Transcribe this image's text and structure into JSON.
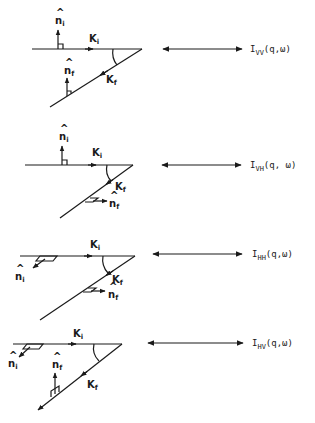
{
  "figure": {
    "rows": [
      {
        "id": "vv",
        "ki_label": "K",
        "ki_sub": "i",
        "kf_label": "K",
        "kf_sub": "f",
        "ni_label": "n",
        "ni_sub": "i",
        "nf_label": "n",
        "nf_sub": "f",
        "intensity_main": "I",
        "intensity_sub": "VV",
        "intensity_args": "(q,ω)",
        "ni_orientation": "vertical-up",
        "nf_orientation": "vertical-up"
      },
      {
        "id": "vh",
        "ki_label": "K",
        "ki_sub": "i",
        "kf_label": "K",
        "kf_sub": "f",
        "ni_label": "n",
        "ni_sub": "i",
        "nf_label": "n",
        "nf_sub": "f",
        "intensity_main": "I",
        "intensity_sub": "VH",
        "intensity_args": "(q, ω)",
        "ni_orientation": "vertical-up",
        "nf_orientation": "horizontal-right"
      },
      {
        "id": "hh",
        "ki_label": "K",
        "ki_sub": "i",
        "kf_label": "K",
        "kf_sub": "f",
        "ni_label": "n",
        "ni_sub": "i",
        "nf_label": "n",
        "nf_sub": "f",
        "intensity_main": "I",
        "intensity_sub": "HH",
        "intensity_args": "(q,ω)",
        "ni_orientation": "in-plane-down-left",
        "nf_orientation": "horizontal-right"
      },
      {
        "id": "hv",
        "ki_label": "K",
        "ki_sub": "i",
        "kf_label": "K",
        "kf_sub": "f",
        "ni_label": "n",
        "ni_sub": "i",
        "nf_label": "n",
        "nf_sub": "f",
        "intensity_main": "I",
        "intensity_sub": "HV",
        "intensity_args": "(q,ω)",
        "ni_orientation": "in-plane-down-left",
        "nf_orientation": "vertical-up"
      }
    ],
    "colors": {
      "ink": "#1a1a1a",
      "background": "#ffffff"
    }
  }
}
